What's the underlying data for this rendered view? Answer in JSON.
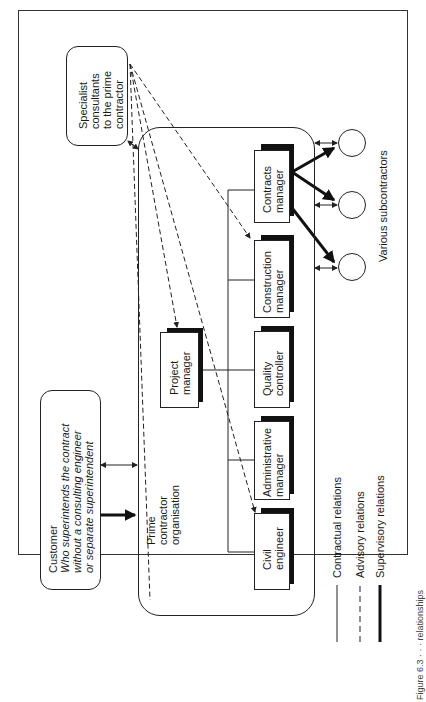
{
  "diagram": {
    "specialist": {
      "lines": [
        "Specialist",
        "consultants",
        "to the prime",
        "contractor"
      ]
    },
    "prime_org": {
      "lines": [
        "Prime",
        "contractor",
        "organisation"
      ]
    },
    "customer": {
      "title": "Customer",
      "desc_lines": [
        "Who superintends the contract",
        "without a consulting engineer",
        "or separate superintendent"
      ]
    },
    "roles": {
      "project_manager": [
        "Project",
        "manager"
      ],
      "contracts_manager": [
        "Contracts",
        "manager"
      ],
      "construction_manager": [
        "Construction",
        "manager"
      ],
      "quality_controller": [
        "Quality",
        "controller"
      ],
      "administrative_manager": [
        "Administrative",
        "manager"
      ],
      "civil_engineer": [
        "Civil",
        "engineer"
      ]
    },
    "subcontractors_label": "Various subcontractors",
    "legend": {
      "contractual": "Contractual relations",
      "advisory": "Advisory relations",
      "supervisory": "Supervisory relations"
    },
    "caption_fragment": "Figure 6.3 · · · relationships"
  },
  "colors": {
    "line": "#222222",
    "shadow": "#111111",
    "background": "#ffffff"
  }
}
